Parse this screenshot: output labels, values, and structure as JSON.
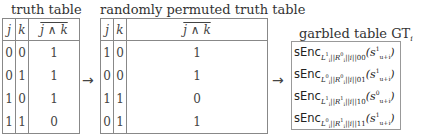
{
  "truth_table": {
    "title": "truth table",
    "headers": [
      "j",
      "k",
      "j ∧ k"
    ],
    "rows": [
      [
        "0",
        "0",
        "1"
      ],
      [
        "0",
        "1",
        "1"
      ],
      [
        "1",
        "0",
        "1"
      ],
      [
        "1",
        "1",
        "0"
      ]
    ]
  },
  "permuted_table": {
    "title": "randomly permuted truth table",
    "headers": [
      "j",
      "k",
      "j ∧ k"
    ],
    "rows": [
      [
        "1",
        "0",
        "1"
      ],
      [
        "0",
        "0",
        "1"
      ],
      [
        "1",
        "1",
        "0"
      ],
      [
        "0",
        "1",
        "1"
      ]
    ]
  },
  "arrows": [
    "→",
    "→"
  ],
  "garbled_table": {
    "title": "garbled table GT",
    "title_sub": "i",
    "func": "sEnc",
    "rows": [
      {
        "L": "1",
        "R": "0",
        "bits": "00",
        "s": "1"
      },
      {
        "L": "0",
        "R": "0",
        "bits": "01",
        "s": "1"
      },
      {
        "L": "1",
        "R": "1",
        "bits": "10",
        "s": "0"
      },
      {
        "L": "0",
        "R": "1",
        "bits": "11",
        "s": "1"
      }
    ],
    "key_sep": "||",
    "index": "i",
    "s_sub": "u+i"
  }
}
